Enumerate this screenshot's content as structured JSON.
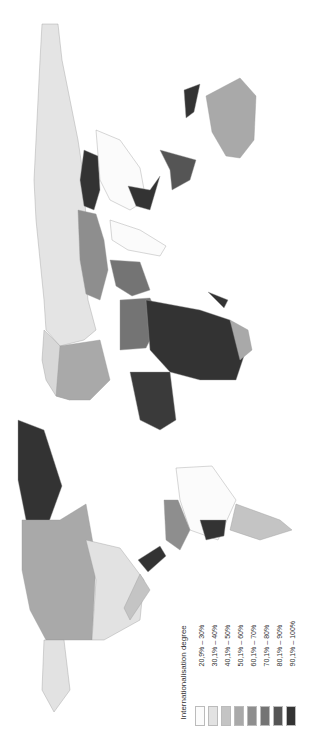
{
  "legend": {
    "title": "Internationalisation degree",
    "items": [
      {
        "label": "20,9% – 30%",
        "color": "#fbfbfb"
      },
      {
        "label": "30,1% – 40%",
        "color": "#e2e2e2"
      },
      {
        "label": "40,1% – 50%",
        "color": "#c4c4c4"
      },
      {
        "label": "50,1% – 60%",
        "color": "#a9a9a9"
      },
      {
        "label": "60,1% – 70%",
        "color": "#8e8e8e"
      },
      {
        "label": "70,1% – 80%",
        "color": "#747474"
      },
      {
        "label": "80,1% – 90%",
        "color": "#555555"
      },
      {
        "label": "90,1% – 100%",
        "color": "#333333"
      }
    ]
  },
  "map": {
    "orientation": "rotated 90° counter-clockwise",
    "regions": [
      {
        "name": "Russia",
        "class": "30,1% – 40%"
      },
      {
        "name": "Greenland",
        "class": "90,1% – 100%"
      },
      {
        "name": "Canada",
        "class": "50,1% – 60%"
      },
      {
        "name": "USA",
        "class": "30,1% – 40%"
      },
      {
        "name": "Brazil",
        "class": "20,9% – 30%"
      },
      {
        "name": "Australia",
        "class": "50,1% – 60%"
      },
      {
        "name": "China",
        "class": "20,9% – 30%"
      },
      {
        "name": "Mongolia",
        "class": "90,1% – 100%"
      },
      {
        "name": "Central Africa",
        "class": "90,1% – 100%"
      },
      {
        "name": "India",
        "class": "20,9% – 30%"
      }
    ]
  }
}
